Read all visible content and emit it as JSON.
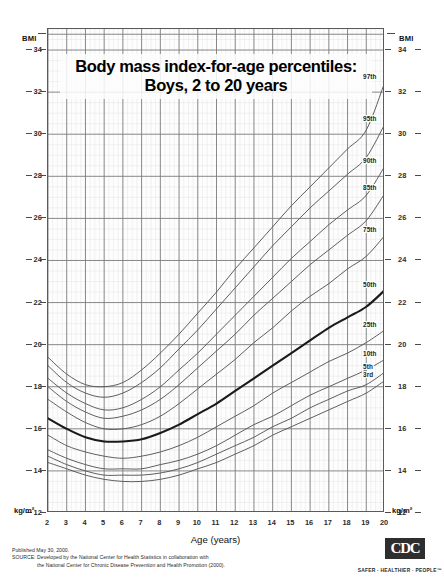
{
  "title": {
    "line1": "Body mass index-for-age percentiles:",
    "line2": "Boys, 2 to 20 years"
  },
  "axes": {
    "y_top_label": "BMI",
    "y_bottom_label": "kg/m²",
    "x_title": "Age (years)"
  },
  "footer": {
    "published": "Published May 30, 2000.",
    "source_line1": "SOURCE: Developed by the National Center for Health Statistics in collaboration with",
    "source_line2": "the National Center for Chronic Disease Prevention and Health Promotion (2000).",
    "cdc_logo": "CDC",
    "cdc_tagline": "SAFER · HEALTHIER · PEOPLE™"
  },
  "chart_data": {
    "type": "line",
    "title": "Body mass index-for-age percentiles: Boys, 2 to 20 years",
    "xlabel": "Age (years)",
    "ylabel": "BMI (kg/m²)",
    "xlim": [
      2,
      20
    ],
    "ylim": [
      12,
      35
    ],
    "xticks": [
      2,
      3,
      4,
      5,
      6,
      7,
      8,
      9,
      10,
      11,
      12,
      13,
      14,
      15,
      16,
      17,
      18,
      19,
      20
    ],
    "yticks": [
      12,
      14,
      16,
      18,
      20,
      22,
      24,
      26,
      28,
      30,
      32,
      34
    ],
    "ytick_labels": [
      "12",
      "14",
      "16",
      "18",
      "20",
      "22",
      "24",
      "26",
      "28",
      "30",
      "32",
      "34"
    ],
    "grid": true,
    "grid_minor": true,
    "legend": "inline-right-labels",
    "x": [
      2,
      3,
      4,
      5,
      6,
      7,
      8,
      9,
      10,
      11,
      12,
      13,
      14,
      15,
      16,
      17,
      18,
      19,
      20
    ],
    "series": [
      {
        "name": "97th",
        "label": "97th",
        "bold": false,
        "color": "#555555",
        "values": [
          19.4,
          18.6,
          18.1,
          18.0,
          18.2,
          18.8,
          19.6,
          20.5,
          21.5,
          22.5,
          23.6,
          24.6,
          25.6,
          26.6,
          27.5,
          28.4,
          29.3,
          30.2,
          32.5
        ]
      },
      {
        "name": "95th",
        "label": "95th",
        "bold": false,
        "color": "#555555",
        "values": [
          19.0,
          18.2,
          17.7,
          17.5,
          17.7,
          18.2,
          18.9,
          19.8,
          20.7,
          21.7,
          22.7,
          23.7,
          24.7,
          25.6,
          26.5,
          27.3,
          28.1,
          28.9,
          30.5
        ]
      },
      {
        "name": "90th",
        "label": "90th",
        "bold": false,
        "color": "#555555",
        "values": [
          18.4,
          17.7,
          17.2,
          16.9,
          17.0,
          17.4,
          18.0,
          18.8,
          19.6,
          20.5,
          21.4,
          22.3,
          23.2,
          24.1,
          24.9,
          25.7,
          26.4,
          27.1,
          28.5
        ]
      },
      {
        "name": "85th",
        "label": "85th",
        "bold": false,
        "color": "#555555",
        "values": [
          18.0,
          17.3,
          16.8,
          16.5,
          16.6,
          16.9,
          17.4,
          18.1,
          18.9,
          19.7,
          20.5,
          21.4,
          22.2,
          23.0,
          23.8,
          24.5,
          25.2,
          25.9,
          27.2
        ]
      },
      {
        "name": "75th",
        "label": "75th",
        "bold": false,
        "color": "#555555",
        "values": [
          17.4,
          16.8,
          16.3,
          16.0,
          16.0,
          16.2,
          16.6,
          17.2,
          17.9,
          18.6,
          19.3,
          20.1,
          20.8,
          21.6,
          22.3,
          22.9,
          23.6,
          24.2,
          25.2
        ]
      },
      {
        "name": "50th",
        "label": "50th",
        "bold": true,
        "color": "#1a1a1a",
        "values": [
          16.5,
          16.0,
          15.6,
          15.4,
          15.4,
          15.5,
          15.8,
          16.2,
          16.7,
          17.2,
          17.8,
          18.4,
          19.0,
          19.6,
          20.2,
          20.8,
          21.3,
          21.8,
          22.6
        ]
      },
      {
        "name": "25th",
        "label": "25th",
        "bold": false,
        "color": "#555555",
        "values": [
          15.7,
          15.2,
          14.9,
          14.7,
          14.6,
          14.7,
          14.9,
          15.2,
          15.6,
          16.1,
          16.6,
          17.1,
          17.7,
          18.2,
          18.7,
          19.2,
          19.6,
          20.1,
          20.7
        ]
      },
      {
        "name": "10th",
        "label": "10th",
        "bold": false,
        "color": "#555555",
        "values": [
          15.0,
          14.6,
          14.3,
          14.1,
          14.1,
          14.1,
          14.3,
          14.5,
          14.8,
          15.2,
          15.7,
          16.2,
          16.6,
          17.1,
          17.6,
          18.0,
          18.4,
          18.8,
          19.3
        ]
      },
      {
        "name": "5th",
        "label": "5th",
        "bold": false,
        "color": "#555555",
        "values": [
          14.7,
          14.3,
          14.0,
          13.8,
          13.8,
          13.8,
          13.9,
          14.1,
          14.4,
          14.8,
          15.2,
          15.6,
          16.1,
          16.5,
          17.0,
          17.4,
          17.8,
          18.1,
          18.7
        ]
      },
      {
        "name": "3rd",
        "label": "3rd",
        "bold": false,
        "color": "#555555",
        "values": [
          14.4,
          14.1,
          13.8,
          13.6,
          13.5,
          13.5,
          13.6,
          13.8,
          14.1,
          14.4,
          14.8,
          15.2,
          15.7,
          16.1,
          16.5,
          16.9,
          17.3,
          17.7,
          18.3
        ]
      }
    ],
    "percentile_label_positions": [
      {
        "label": "97th",
        "bmi": 32.5
      },
      {
        "label": "95th",
        "bmi": 30.5
      },
      {
        "label": "90th",
        "bmi": 28.5
      },
      {
        "label": "85th",
        "bmi": 27.2
      },
      {
        "label": "75th",
        "bmi": 25.2
      },
      {
        "label": "50th",
        "bmi": 22.6
      },
      {
        "label": "25th",
        "bmi": 20.7
      },
      {
        "label": "10th",
        "bmi": 19.3
      },
      {
        "label": "5th",
        "bmi": 18.7
      },
      {
        "label": "3rd",
        "bmi": 18.3
      }
    ]
  }
}
